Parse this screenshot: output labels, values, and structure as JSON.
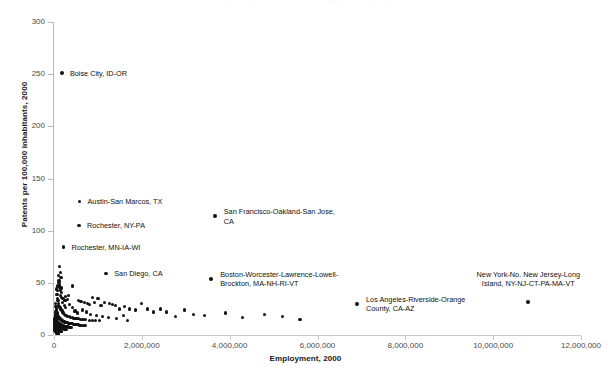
{
  "chart_data": {
    "type": "scatter",
    "title": "Patents per 100,000 inhabitants and employment by MSA, 2000",
    "xlabel": "Employment, 2000",
    "ylabel": "Patents per 100,000 inhabitants, 2000",
    "xlim": [
      0,
      12000000
    ],
    "ylim": [
      0,
      300
    ],
    "grid": false,
    "legend": null,
    "x_ticks": [
      {
        "value": 0,
        "label": "0"
      },
      {
        "value": 2000000,
        "label": "2,000,000"
      },
      {
        "value": 4000000,
        "label": "4,000,000"
      },
      {
        "value": 6000000,
        "label": "6,000,000"
      },
      {
        "value": 8000000,
        "label": "8,000,000"
      },
      {
        "value": 10000000,
        "label": "10,000,000"
      },
      {
        "value": 12000000,
        "label": "12,000,000"
      }
    ],
    "y_ticks": [
      {
        "value": 0,
        "label": "0"
      },
      {
        "value": 50,
        "label": "50"
      },
      {
        "value": 100,
        "label": "100"
      },
      {
        "value": 150,
        "label": "150"
      },
      {
        "value": 200,
        "label": "200"
      },
      {
        "value": 250,
        "label": "250"
      },
      {
        "value": 300,
        "label": "300"
      }
    ],
    "annotations": [
      {
        "label": "Boise City, ID-OR",
        "x": 180000,
        "y": 251,
        "align": "left",
        "dx": 8,
        "dy": -4
      },
      {
        "label": "Austin-San Marcos, TX",
        "x": 580000,
        "y": 128,
        "align": "left",
        "dx": 8,
        "dy": -4
      },
      {
        "label": "Rochester, NY-PA",
        "x": 570000,
        "y": 105,
        "align": "left",
        "dx": 8,
        "dy": -4
      },
      {
        "label": "Rochester, MN-IA-WI",
        "x": 215000,
        "y": 84,
        "align": "left",
        "dx": 8,
        "dy": -4
      },
      {
        "label": "San Diego, CA",
        "x": 1190000,
        "y": 59,
        "align": "left",
        "dx": 8,
        "dy": -4
      },
      {
        "label": "San Francisco-Oakland-San Jose,\nCA",
        "x": 3660000,
        "y": 114,
        "align": "left",
        "dx": 9,
        "dy": -9
      },
      {
        "label": "Boston-Worcester-Lawrence-Lowell-\nBrockton, MA-NH-RI-VT",
        "x": 3580000,
        "y": 54,
        "align": "left",
        "dx": 9,
        "dy": -9
      },
      {
        "label": "Los Angeles-Riverside-Orange\nCounty, CA-AZ",
        "x": 6900000,
        "y": 30,
        "align": "left",
        "dx": 9,
        "dy": -9
      },
      {
        "label": "New York-No. New Jersey-Long\nIsland, NY-NJ-CT-PA-MA-VT",
        "x": 10800000,
        "y": 32,
        "align": "ctr",
        "dx": 0,
        "dy": 24
      }
    ],
    "points": [
      [
        180000,
        251
      ],
      [
        580000,
        128
      ],
      [
        570000,
        105
      ],
      [
        215000,
        84
      ],
      [
        1190000,
        59
      ],
      [
        3660000,
        114
      ],
      [
        3580000,
        54
      ],
      [
        6900000,
        30
      ],
      [
        10800000,
        32
      ],
      [
        130000,
        66
      ],
      [
        145000,
        60
      ],
      [
        160000,
        55
      ],
      [
        120000,
        48
      ],
      [
        430000,
        47
      ],
      [
        175000,
        41
      ],
      [
        330000,
        38
      ],
      [
        255000,
        37
      ],
      [
        880000,
        36
      ],
      [
        1000000,
        35
      ],
      [
        560000,
        33
      ],
      [
        615000,
        32
      ],
      [
        700000,
        31
      ],
      [
        760000,
        30
      ],
      [
        810000,
        29
      ],
      [
        930000,
        31
      ],
      [
        1070000,
        28
      ],
      [
        1150000,
        31
      ],
      [
        1260000,
        30
      ],
      [
        1330000,
        29
      ],
      [
        1400000,
        28
      ],
      [
        1490000,
        25
      ],
      [
        1600000,
        27
      ],
      [
        1720000,
        25
      ],
      [
        1850000,
        24
      ],
      [
        2000000,
        30
      ],
      [
        2120000,
        25
      ],
      [
        2260000,
        22
      ],
      [
        2430000,
        25
      ],
      [
        2560000,
        22
      ],
      [
        2760000,
        18
      ],
      [
        2980000,
        24
      ],
      [
        3180000,
        20
      ],
      [
        3420000,
        19
      ],
      [
        3900000,
        21
      ],
      [
        4300000,
        17
      ],
      [
        4800000,
        20
      ],
      [
        5200000,
        18
      ],
      [
        5600000,
        15
      ],
      [
        60000,
        44
      ],
      [
        70000,
        39
      ],
      [
        80000,
        35
      ],
      [
        90000,
        33
      ],
      [
        100000,
        30
      ],
      [
        110000,
        28
      ],
      [
        125000,
        27
      ],
      [
        135000,
        26
      ],
      [
        150000,
        25
      ],
      [
        165000,
        24
      ],
      [
        185000,
        23
      ],
      [
        200000,
        22
      ],
      [
        220000,
        21
      ],
      [
        240000,
        20
      ],
      [
        265000,
        19
      ],
      [
        290000,
        19
      ],
      [
        315000,
        18
      ],
      [
        345000,
        18
      ],
      [
        380000,
        17
      ],
      [
        415000,
        17
      ],
      [
        455000,
        16
      ],
      [
        500000,
        16
      ],
      [
        545000,
        16
      ],
      [
        600000,
        15
      ],
      [
        660000,
        15
      ],
      [
        725000,
        15
      ],
      [
        800000,
        14
      ],
      [
        870000,
        14
      ],
      [
        950000,
        14
      ],
      [
        1040000,
        14
      ],
      [
        40000,
        30
      ],
      [
        45000,
        27
      ],
      [
        50000,
        25
      ],
      [
        55000,
        23
      ],
      [
        62000,
        22
      ],
      [
        68000,
        21
      ],
      [
        75000,
        20
      ],
      [
        82000,
        19
      ],
      [
        88000,
        19
      ],
      [
        95000,
        18
      ],
      [
        102000,
        18
      ],
      [
        108000,
        17
      ],
      [
        115000,
        17
      ],
      [
        122000,
        16
      ],
      [
        130000,
        16
      ],
      [
        138000,
        16
      ],
      [
        146000,
        15
      ],
      [
        155000,
        15
      ],
      [
        163000,
        15
      ],
      [
        172000,
        14
      ],
      [
        182000,
        14
      ],
      [
        192000,
        14
      ],
      [
        203000,
        13
      ],
      [
        214000,
        13
      ],
      [
        226000,
        13
      ],
      [
        238000,
        13
      ],
      [
        251000,
        12
      ],
      [
        265000,
        12
      ],
      [
        280000,
        12
      ],
      [
        296000,
        12
      ],
      [
        313000,
        12
      ],
      [
        331000,
        11
      ],
      [
        350000,
        11
      ],
      [
        370000,
        11
      ],
      [
        392000,
        11
      ],
      [
        415000,
        11
      ],
      [
        440000,
        10
      ],
      [
        466000,
        10
      ],
      [
        494000,
        10
      ],
      [
        524000,
        10
      ],
      [
        556000,
        10
      ],
      [
        590000,
        9
      ],
      [
        626000,
        9
      ],
      [
        664000,
        9
      ],
      [
        705000,
        9
      ],
      [
        25000,
        22
      ],
      [
        28000,
        20
      ],
      [
        31000,
        19
      ],
      [
        34000,
        18
      ],
      [
        37000,
        17
      ],
      [
        41000,
        16
      ],
      [
        44000,
        16
      ],
      [
        48000,
        15
      ],
      [
        52000,
        15
      ],
      [
        56000,
        14
      ],
      [
        60000,
        14
      ],
      [
        65000,
        13
      ],
      [
        70000,
        13
      ],
      [
        75000,
        13
      ],
      [
        80000,
        12
      ],
      [
        86000,
        12
      ],
      [
        92000,
        12
      ],
      [
        98000,
        11
      ],
      [
        105000,
        11
      ],
      [
        112000,
        11
      ],
      [
        119000,
        11
      ],
      [
        127000,
        10
      ],
      [
        135000,
        10
      ],
      [
        144000,
        10
      ],
      [
        153000,
        10
      ],
      [
        163000,
        10
      ],
      [
        173000,
        9
      ],
      [
        184000,
        9
      ],
      [
        196000,
        9
      ],
      [
        208000,
        9
      ],
      [
        221000,
        9
      ],
      [
        235000,
        8
      ],
      [
        250000,
        8
      ],
      [
        266000,
        8
      ],
      [
        283000,
        8
      ],
      [
        301000,
        8
      ],
      [
        320000,
        8
      ],
      [
        340000,
        7
      ],
      [
        362000,
        7
      ],
      [
        385000,
        7
      ],
      [
        15000,
        16
      ],
      [
        17000,
        15
      ],
      [
        19000,
        14
      ],
      [
        21000,
        14
      ],
      [
        23000,
        13
      ],
      [
        25000,
        13
      ],
      [
        27000,
        12
      ],
      [
        29000,
        12
      ],
      [
        32000,
        11
      ],
      [
        35000,
        11
      ],
      [
        38000,
        11
      ],
      [
        41000,
        10
      ],
      [
        44000,
        10
      ],
      [
        47000,
        10
      ],
      [
        51000,
        9
      ],
      [
        55000,
        9
      ],
      [
        59000,
        9
      ],
      [
        63000,
        9
      ],
      [
        68000,
        8
      ],
      [
        73000,
        8
      ],
      [
        78000,
        8
      ],
      [
        84000,
        8
      ],
      [
        90000,
        8
      ],
      [
        96000,
        7
      ],
      [
        103000,
        7
      ],
      [
        110000,
        7
      ],
      [
        118000,
        7
      ],
      [
        126000,
        7
      ],
      [
        135000,
        7
      ],
      [
        144000,
        6
      ],
      [
        154000,
        6
      ],
      [
        165000,
        6
      ],
      [
        176000,
        6
      ],
      [
        188000,
        6
      ],
      [
        201000,
        6
      ],
      [
        215000,
        6
      ],
      [
        230000,
        5
      ],
      [
        246000,
        5
      ],
      [
        263000,
        5
      ],
      [
        281000,
        5
      ],
      [
        10000,
        11
      ],
      [
        12000,
        10
      ],
      [
        14000,
        10
      ],
      [
        16000,
        9
      ],
      [
        18000,
        9
      ],
      [
        20000,
        8
      ],
      [
        22000,
        8
      ],
      [
        24000,
        8
      ],
      [
        26000,
        7
      ],
      [
        28000,
        7
      ],
      [
        31000,
        7
      ],
      [
        34000,
        7
      ],
      [
        37000,
        6
      ],
      [
        40000,
        6
      ],
      [
        43000,
        6
      ],
      [
        46000,
        6
      ],
      [
        50000,
        6
      ],
      [
        54000,
        5
      ],
      [
        58000,
        5
      ],
      [
        62000,
        5
      ],
      [
        67000,
        5
      ],
      [
        72000,
        5
      ],
      [
        77000,
        5
      ],
      [
        83000,
        4
      ],
      [
        89000,
        4
      ],
      [
        95000,
        4
      ],
      [
        102000,
        4
      ],
      [
        109000,
        4
      ],
      [
        117000,
        4
      ],
      [
        125000,
        4
      ],
      [
        134000,
        3
      ],
      [
        143000,
        3
      ],
      [
        153000,
        3
      ],
      [
        164000,
        3
      ],
      [
        175000,
        3
      ],
      [
        8000,
        7
      ],
      [
        9000,
        6
      ],
      [
        11000,
        6
      ],
      [
        13000,
        6
      ],
      [
        15000,
        5
      ],
      [
        17000,
        5
      ],
      [
        19000,
        5
      ],
      [
        21000,
        5
      ],
      [
        23000,
        4
      ],
      [
        26000,
        4
      ],
      [
        29000,
        4
      ],
      [
        32000,
        4
      ],
      [
        35000,
        4
      ],
      [
        39000,
        3
      ],
      [
        43000,
        3
      ],
      [
        47000,
        3
      ],
      [
        52000,
        3
      ],
      [
        57000,
        3
      ],
      [
        63000,
        3
      ],
      [
        69000,
        2
      ],
      [
        76000,
        2
      ],
      [
        84000,
        2
      ],
      [
        92000,
        2
      ],
      [
        101000,
        2
      ],
      [
        111000,
        2
      ],
      [
        300000,
        34
      ],
      [
        360000,
        29
      ],
      [
        420000,
        26
      ],
      [
        480000,
        23
      ],
      [
        540000,
        21
      ],
      [
        640000,
        24
      ],
      [
        740000,
        22
      ],
      [
        840000,
        20
      ],
      [
        960000,
        19
      ],
      [
        1100000,
        18
      ],
      [
        1250000,
        17
      ],
      [
        1420000,
        16
      ],
      [
        1580000,
        19
      ],
      [
        1680000,
        14
      ],
      [
        190000,
        31
      ],
      [
        230000,
        28
      ],
      [
        270000,
        26
      ],
      [
        205000,
        35
      ],
      [
        250000,
        33
      ],
      [
        152000,
        38
      ],
      [
        168000,
        36
      ],
      [
        140000,
        43
      ],
      [
        158000,
        45
      ],
      [
        115000,
        52
      ],
      [
        98000,
        57
      ],
      [
        112000,
        50
      ],
      [
        128000,
        46
      ],
      [
        88000,
        43
      ],
      [
        76000,
        47
      ]
    ]
  }
}
